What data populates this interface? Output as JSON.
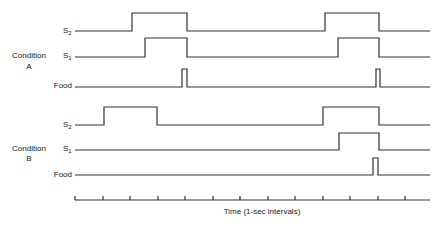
{
  "diagram": {
    "x_axis_label": "Time (1-sec intervals)",
    "conditions": [
      {
        "label_line1": "Condition",
        "label_line2": "A",
        "signals": [
          {
            "name_main": "S",
            "name_sub": "2",
            "baseline_y": 31,
            "high_y": 13,
            "pulses": [
              [
                132,
                187
              ],
              [
                325,
                379
              ]
            ]
          },
          {
            "name_main": "S",
            "name_sub": "1",
            "baseline_y": 57,
            "high_y": 38,
            "pulses": [
              [
                145,
                187
              ],
              [
                338,
                379
              ]
            ]
          },
          {
            "name_main": "Food",
            "name_sub": "",
            "baseline_y": 87,
            "high_y": 69,
            "pulses": [
              [
                182,
                187
              ],
              [
                376,
                380
              ]
            ]
          }
        ]
      },
      {
        "label_line1": "Condition",
        "label_line2": "B",
        "signals": [
          {
            "name_main": "S",
            "name_sub": "2",
            "baseline_y": 125,
            "high_y": 107,
            "pulses": [
              [
                104,
                157
              ],
              [
                323,
                379
              ]
            ]
          },
          {
            "name_main": "S",
            "name_sub": "1",
            "baseline_y": 150,
            "high_y": 133,
            "pulses": [
              [
                339,
                379
              ]
            ]
          },
          {
            "name_main": "Food",
            "name_sub": "",
            "baseline_y": 175,
            "high_y": 158,
            "pulses": [
              [
                373,
                378
              ]
            ]
          }
        ]
      }
    ],
    "time_axis": {
      "y": 200,
      "x_start": 75,
      "x_end": 430,
      "ticks": [
        75,
        103,
        130,
        158,
        185,
        213,
        240,
        268,
        295,
        323,
        350,
        378,
        405
      ]
    }
  }
}
